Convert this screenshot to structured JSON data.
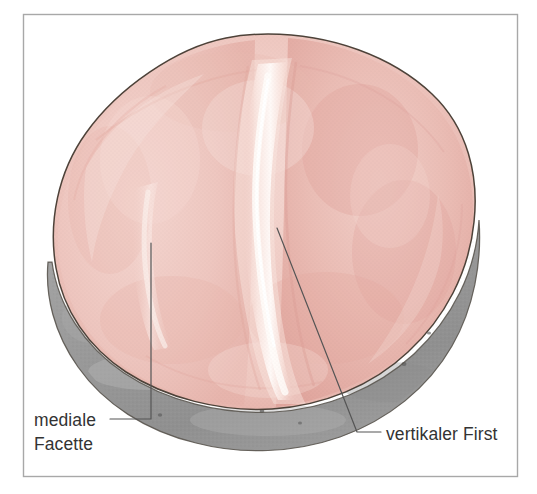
{
  "figure": {
    "frame": {
      "border_color": "#a8a8a8",
      "background": "#ffffff",
      "x": 23,
      "y": 14,
      "width": 495,
      "height": 463
    }
  },
  "colors": {
    "cartilage_base": "#f0cdc6",
    "cartilage_mid": "#ecbdb5",
    "cartilage_dark": "#e5a9a2",
    "cartilage_light": "#f6e0da",
    "ridge_highlight": "#fdf4f0",
    "bone_gray": "#9b9b9b",
    "bone_gray_dark": "#8a8a8a",
    "bone_gray_light": "#b0b0b0",
    "outline": "#4d4239",
    "leader_line": "#555555",
    "label_text": "#333333"
  },
  "labels": [
    {
      "id": "mediale-facette",
      "lines": [
        "mediale",
        "Facette"
      ],
      "line1": "mediale",
      "line2": "Facette",
      "text_x": 34,
      "text_y1": 426,
      "text_y2": 450,
      "leader": {
        "type": "elbow",
        "points": "110,419 151,419 151,243",
        "anchor_x": 151,
        "anchor_y": 243
      }
    },
    {
      "id": "vertikaler-first",
      "lines": [
        "vertikaler First"
      ],
      "line1": "vertikaler First",
      "text_x": 386,
      "text_y1": 440,
      "leader": {
        "type": "diagonal-elbow",
        "points": "381,432 357,432 277,228",
        "anchor_x": 277,
        "anchor_y": 228
      }
    }
  ],
  "structures": [
    {
      "id": "articular-cartilage",
      "name": "Knorpelüberzug der Facies articularis patellae",
      "color": "#f0cdc6"
    },
    {
      "id": "medial-facet",
      "name": "mediale Facette",
      "color": "#eec5bd"
    },
    {
      "id": "lateral-facet",
      "name": "laterale Facette",
      "color": "#e8b3ab"
    },
    {
      "id": "vertical-ridge",
      "name": "vertikaler First",
      "color": "#fdf4f0"
    },
    {
      "id": "bone-rim",
      "name": "Knochenrand / Apex patellae",
      "color": "#9b9b9b"
    }
  ]
}
